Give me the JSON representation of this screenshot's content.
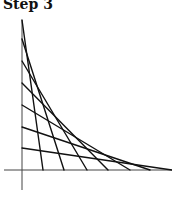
{
  "title": "Step 3",
  "diagram": {
    "type": "curve-stitching",
    "axes": {
      "vertical": {
        "x": 22,
        "y1": 20,
        "y2": 190
      },
      "horizontal": {
        "y": 170,
        "x1": 4,
        "x2": 172
      }
    },
    "y_points": [
      20,
      39,
      61,
      83,
      105,
      127,
      148
    ],
    "x_points": [
      43,
      64,
      87,
      108,
      130,
      150,
      172
    ],
    "line_color": "#111111",
    "axis_color": "#444444"
  }
}
